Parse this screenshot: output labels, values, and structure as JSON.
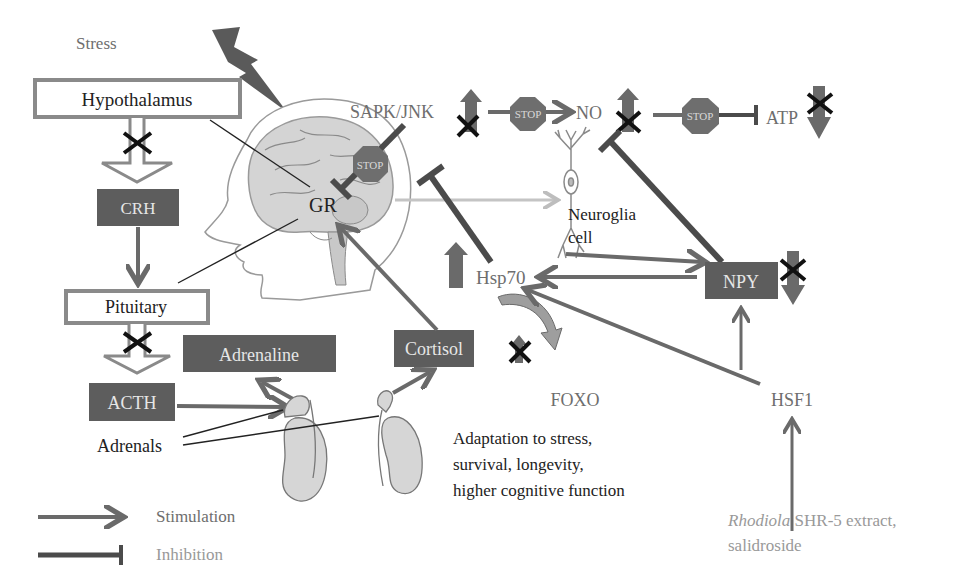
{
  "title_label": "Stress",
  "nodes": {
    "hypothalamus": "Hypothalamus",
    "crh": "CRH",
    "pituitary": "Pituitary",
    "acth": "ACTH",
    "adrenaline": "Adrenaline",
    "cortisol": "Cortisol",
    "adrenals": "Adrenals",
    "gr": "GR",
    "sapk_jnk": "SAPK/JNK",
    "no": "NO",
    "atp": "ATP",
    "neuroglia_line1": "Neuroglia",
    "neuroglia_line2": "cell",
    "hsp70": "Hsp70",
    "npy": "NPY",
    "foxo": "FOXO",
    "hsf1": "HSF1"
  },
  "stop_sign_label": "STOP",
  "outcome": {
    "line1": "Adaptation to stress,",
    "line2": "survival, longevity,",
    "line3": "higher cognitive function"
  },
  "source": {
    "italic": "Rhodiola",
    "rest": " SHR-5 extract,",
    "line2": "salidroside"
  },
  "legend": {
    "stimulation": "Stimulation",
    "inhibition": "Inhibition"
  },
  "colors": {
    "dark_box": "#5d5d5d",
    "arrow": "#6a6a6a",
    "inhibition": "#4b4b4b"
  }
}
